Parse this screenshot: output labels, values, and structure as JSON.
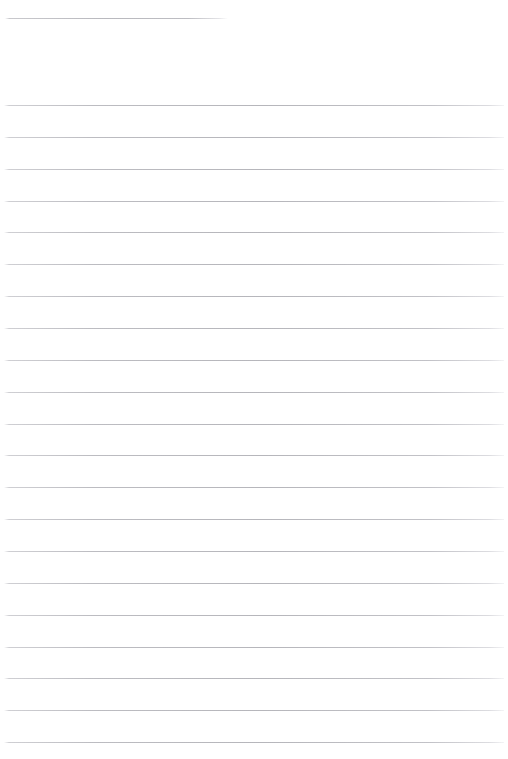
{
  "document": {
    "type": "ruled-paper",
    "page_width": 508,
    "page_height": 759,
    "background_color": "#ffffff",
    "rule_color": "#b9b9be",
    "content_text": "",
    "title_text": ""
  },
  "title_rule": {
    "name": "title-rule",
    "x": 5,
    "y": 18,
    "width": 223,
    "thickness": 1,
    "color": "#b9b9be"
  },
  "body_rules": {
    "name": "body-rules",
    "count": 21,
    "left": 4,
    "right": 504,
    "width": 500,
    "first_y": 105,
    "spacing": 31.85,
    "thickness": 1,
    "color": "#b6b6bb",
    "positions": [
      105.0,
      136.9,
      168.7,
      200.6,
      232.4,
      264.3,
      296.1,
      328.0,
      359.8,
      391.7,
      423.5,
      455.4,
      487.2,
      519.1,
      550.9,
      582.8,
      614.6,
      646.5,
      678.3,
      710.2,
      742.0
    ]
  }
}
